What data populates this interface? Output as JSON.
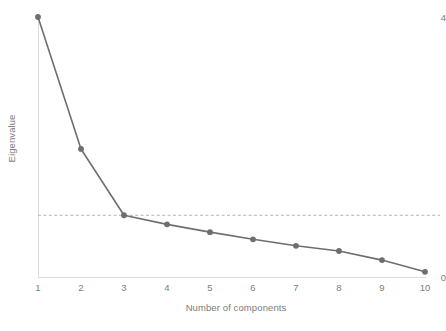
{
  "chart_data": {
    "type": "line",
    "title": "",
    "subtitle": "",
    "xlabel": "Number of components",
    "ylabel": "Eigenvalue",
    "categories": [
      1,
      2,
      3,
      4,
      5,
      6,
      7,
      8,
      9,
      10
    ],
    "x": [
      1,
      2,
      3,
      4,
      5,
      6,
      7,
      8,
      9,
      10
    ],
    "values": [
      4.0,
      1.97,
      0.95,
      0.81,
      0.69,
      0.58,
      0.48,
      0.4,
      0.26,
      0.08
    ],
    "series": [
      {
        "name": "Eigenvalue",
        "values": [
          4.0,
          1.97,
          0.95,
          0.81,
          0.69,
          0.58,
          0.48,
          0.4,
          0.26,
          0.08
        ]
      }
    ],
    "xlim": [
      1,
      10
    ],
    "ylim": [
      0,
      4
    ],
    "x_tick_labels": [
      "1",
      "2",
      "3",
      "4",
      "5",
      "6",
      "7",
      "8",
      "9",
      "10"
    ],
    "y_tick_labels": [
      "0",
      "4"
    ],
    "y_tick_values": [
      0,
      4
    ],
    "grid": false,
    "legend": false,
    "legend_position": "none",
    "annotations": [
      {
        "name": "kaiser-criterion-reference-line",
        "type": "horizontal-dashed-line",
        "value": 0.95,
        "label": ""
      }
    ],
    "marker": "circle",
    "colors": {
      "series_line": "#6e6e6e",
      "series_marker": "#6e6e6e",
      "reference_line": "#b0b0c4",
      "axis": "#dcdcdc",
      "tick_label": "#7c7c7c",
      "axis_title": "#7c7c7c",
      "background": "#ffffff"
    }
  },
  "icons": {}
}
